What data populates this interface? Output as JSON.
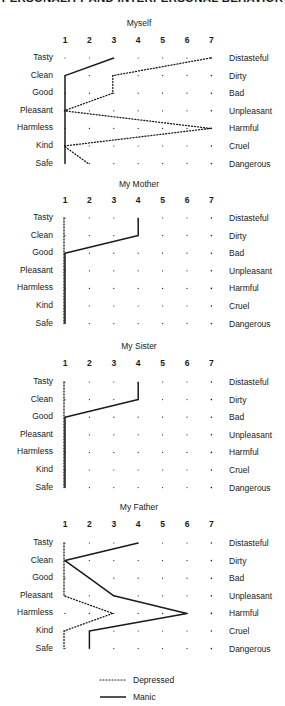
{
  "header": {
    "title": "PERSONALITY AND INTERPERSONAL BEHAVIOR"
  },
  "legend": {
    "depressed_label": "Depressed",
    "manic_label": "Manic"
  },
  "chart_data": [
    {
      "type": "line",
      "title": "Myself",
      "x_ticks": [
        1,
        2,
        3,
        4,
        5,
        6,
        7
      ],
      "left_labels": [
        "Tasty",
        "Clean",
        "Good",
        "Pleasant",
        "Harmless",
        "Kind",
        "Safe"
      ],
      "right_labels": [
        "Distasteful",
        "Dirty",
        "Bad",
        "Unpleasant",
        "Harmful",
        "Cruel",
        "Dangerous"
      ],
      "series": [
        {
          "name": "Manic",
          "style": "solid",
          "values": [
            3,
            1,
            1,
            1,
            1,
            1,
            1
          ]
        },
        {
          "name": "Depressed",
          "style": "dotted",
          "values": [
            7,
            3,
            3,
            1,
            7,
            1,
            2
          ]
        }
      ]
    },
    {
      "type": "line",
      "title": "My Mother",
      "x_ticks": [
        1,
        2,
        3,
        4,
        5,
        6,
        7
      ],
      "left_labels": [
        "Tasty",
        "Clean",
        "Good",
        "Pleasant",
        "Harmless",
        "Kind",
        "Safe"
      ],
      "right_labels": [
        "Distasteful",
        "Dirty",
        "Bad",
        "Unpleasant",
        "Harmful",
        "Cruel",
        "Dangerous"
      ],
      "series": [
        {
          "name": "Manic",
          "style": "solid",
          "values": [
            4,
            4,
            1,
            1,
            1,
            1,
            1
          ]
        },
        {
          "name": "Depressed",
          "style": "dotted",
          "values": [
            1,
            1,
            1,
            1,
            1,
            1,
            1
          ]
        }
      ]
    },
    {
      "type": "line",
      "title": "My Sister",
      "x_ticks": [
        1,
        2,
        3,
        4,
        5,
        6,
        7
      ],
      "left_labels": [
        "Tasty",
        "Clean",
        "Good",
        "Pleasant",
        "Harmless",
        "Kind",
        "Safe"
      ],
      "right_labels": [
        "Distasteful",
        "Dirty",
        "Bad",
        "Unpleasant",
        "Harmful",
        "Cruel",
        "Dangerous"
      ],
      "series": [
        {
          "name": "Manic",
          "style": "solid",
          "values": [
            4,
            4,
            1,
            1,
            1,
            1,
            1
          ]
        },
        {
          "name": "Depressed",
          "style": "dotted",
          "values": [
            1,
            1,
            1,
            1,
            1,
            1,
            1
          ]
        }
      ]
    },
    {
      "type": "line",
      "title": "My Father",
      "x_ticks": [
        1,
        2,
        3,
        4,
        5,
        6,
        7
      ],
      "left_labels": [
        "Tasty",
        "Clean",
        "Good",
        "Pleasant",
        "Harmless",
        "Kind",
        "Safe"
      ],
      "right_labels": [
        "Distasteful",
        "Dirty",
        "Bad",
        "Unpleasant",
        "Harmful",
        "Cruel",
        "Dangerous"
      ],
      "series": [
        {
          "name": "Manic",
          "style": "solid",
          "values": [
            4,
            1,
            2,
            3,
            6,
            2,
            2
          ]
        },
        {
          "name": "Depressed",
          "style": "dotted",
          "values": [
            1,
            1,
            1,
            1,
            3,
            1,
            1
          ]
        }
      ]
    }
  ],
  "colors": {
    "ink": "#1a1a1a",
    "background": "#ffffff"
  }
}
